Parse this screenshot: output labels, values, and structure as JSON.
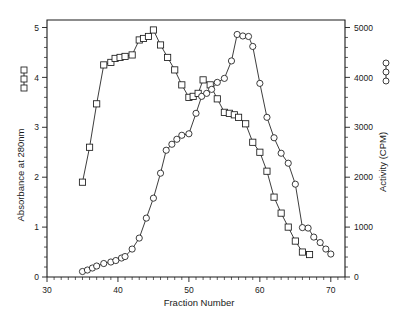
{
  "chart_data": {
    "type": "line",
    "title": "",
    "xlabel": "Fraction Number",
    "ylabel": "Absorbance at 280nm",
    "y2label": "Activity (CPM)",
    "xlim": [
      30,
      72
    ],
    "ylim": [
      0,
      5.15
    ],
    "y2lim": [
      0,
      5150
    ],
    "xticks": [
      30,
      40,
      50,
      60,
      70
    ],
    "xticklabels": [
      "30",
      "40",
      "50",
      "60",
      "70"
    ],
    "yticks": [
      0,
      1,
      2,
      3,
      4,
      5
    ],
    "yticklabels": [
      "0",
      "1",
      "2",
      "3",
      "4",
      "5"
    ],
    "y2ticks": [
      0,
      1000,
      2000,
      3000,
      4000,
      5000
    ],
    "y2ticklabels": [
      "0",
      "1000",
      "2000",
      "3000",
      "4000",
      "5000"
    ],
    "grid": false,
    "legend_position": "axis-labels",
    "series": [
      {
        "name": "Absorbance at 280nm",
        "marker": "square",
        "axis": "left",
        "x": [
          35,
          36,
          37,
          38,
          39,
          39.6,
          40.3,
          41,
          42,
          43,
          43.6,
          44.3,
          45,
          46,
          47,
          48,
          49,
          50,
          50.6,
          51.3,
          52,
          53,
          54,
          55,
          55.7,
          56.4,
          57,
          58,
          59,
          60,
          61,
          62,
          63,
          64,
          65,
          66,
          67
        ],
        "y": [
          1.9,
          2.6,
          3.47,
          4.25,
          4.3,
          4.38,
          4.4,
          4.42,
          4.45,
          4.75,
          4.78,
          4.82,
          4.95,
          4.65,
          4.4,
          4.15,
          3.85,
          3.6,
          3.62,
          3.68,
          3.95,
          3.85,
          3.57,
          3.3,
          3.28,
          3.25,
          3.2,
          3.07,
          2.7,
          2.5,
          2.12,
          1.6,
          1.28,
          1.0,
          0.72,
          0.5,
          0.45
        ]
      },
      {
        "name": "Activity (CPM)",
        "marker": "circle",
        "axis": "right",
        "x": [
          35,
          35.7,
          36.4,
          37,
          38,
          39,
          39.7,
          40.5,
          41,
          42,
          43,
          44,
          45,
          46,
          46.8,
          47.6,
          48.3,
          49,
          50,
          51,
          51.8,
          52.5,
          53.2,
          54,
          55,
          56,
          56.8,
          57.6,
          58.4,
          59,
          60,
          61,
          62,
          63,
          64,
          65,
          66,
          66.8,
          67.6,
          68.5,
          69.3,
          70
        ],
        "y": [
          110,
          140,
          180,
          220,
          270,
          300,
          330,
          380,
          410,
          560,
          780,
          1180,
          1580,
          2080,
          2540,
          2660,
          2760,
          2840,
          2870,
          3280,
          3620,
          3680,
          3760,
          3900,
          3980,
          4330,
          4860,
          4830,
          4820,
          4620,
          3880,
          3200,
          2790,
          2480,
          2280,
          1860,
          990,
          980,
          800,
          690,
          560,
          460
        ]
      }
    ]
  },
  "left_axis": {
    "title": "Absorbance at 280nm",
    "legend_marker": "square-marker-legend"
  },
  "right_axis": {
    "title": "Activity (CPM)",
    "legend_marker": "circle-marker-legend"
  },
  "x_axis": {
    "title": "Fraction Number"
  }
}
